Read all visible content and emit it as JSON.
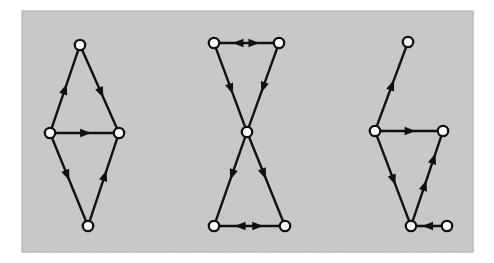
{
  "figure": {
    "width": 494,
    "height": 263,
    "background_color": "#ffffff",
    "panel": {
      "x": 22,
      "y": 11,
      "width": 451,
      "height": 241,
      "fill_color": "#c9c9c9",
      "border_color": "#9a9a9a"
    },
    "style": {
      "edge_color": "#101010",
      "edge_width": 2.4,
      "node_fill": "#ffffff",
      "node_stroke": "#101010",
      "node_stroke_width": 2.3,
      "node_radius": 5.2,
      "arrow_length": 11,
      "arrow_half_width": 4.2
    }
  },
  "chart_data": {
    "type": "diagram",
    "subtype": "directed-graph",
    "graphs": [
      {
        "id": "graph-left",
        "name": "diamond-graph",
        "nodes": [
          {
            "id": "T",
            "label": "top",
            "x": 80,
            "y": 45
          },
          {
            "id": "L",
            "label": "left",
            "x": 50,
            "y": 133
          },
          {
            "id": "R",
            "label": "right",
            "x": 119,
            "y": 133
          },
          {
            "id": "B",
            "label": "bottom",
            "x": 88,
            "y": 226
          }
        ],
        "edges": [
          {
            "from": "L",
            "to": "T",
            "arrows": [
              {
                "t": 0.5,
                "dir": "forward"
              }
            ]
          },
          {
            "from": "T",
            "to": "R",
            "arrows": [
              {
                "t": 0.55,
                "dir": "forward"
              }
            ]
          },
          {
            "from": "L",
            "to": "R",
            "arrows": [
              {
                "t": 0.52,
                "dir": "forward"
              }
            ]
          },
          {
            "from": "L",
            "to": "B",
            "arrows": [
              {
                "t": 0.45,
                "dir": "forward"
              }
            ]
          },
          {
            "from": "B",
            "to": "R",
            "arrows": [
              {
                "t": 0.55,
                "dir": "forward"
              }
            ]
          }
        ]
      },
      {
        "id": "graph-middle",
        "name": "bowtie-graph",
        "nodes": [
          {
            "id": "TL",
            "label": "top-left",
            "x": 214,
            "y": 43
          },
          {
            "id": "TR",
            "label": "top-right",
            "x": 279,
            "y": 43
          },
          {
            "id": "C",
            "label": "center",
            "x": 247,
            "y": 132
          },
          {
            "id": "BL",
            "label": "bottom-left",
            "x": 214,
            "y": 226
          },
          {
            "id": "BR",
            "label": "bottom-right",
            "x": 285,
            "y": 226
          }
        ],
        "edges": [
          {
            "from": "TL",
            "to": "TR",
            "arrows": [
              {
                "t": 0.34,
                "dir": "backward"
              },
              {
                "t": 0.64,
                "dir": "forward"
              }
            ]
          },
          {
            "from": "TL",
            "to": "C",
            "arrows": [
              {
                "t": 0.52,
                "dir": "forward"
              }
            ]
          },
          {
            "from": "TR",
            "to": "C",
            "arrows": [
              {
                "t": 0.5,
                "dir": "forward"
              }
            ]
          },
          {
            "from": "C",
            "to": "BL",
            "arrows": [
              {
                "t": 0.45,
                "dir": "forward"
              }
            ]
          },
          {
            "from": "C",
            "to": "BR",
            "arrows": [
              {
                "t": 0.44,
                "dir": "forward"
              }
            ]
          },
          {
            "from": "BL",
            "to": "BR",
            "arrows": [
              {
                "t": 0.34,
                "dir": "backward"
              },
              {
                "t": 0.64,
                "dir": "forward"
              }
            ]
          }
        ]
      },
      {
        "id": "graph-right",
        "name": "triangle-with-pendants-graph",
        "nodes": [
          {
            "id": "P1",
            "label": "top-pendant",
            "x": 408,
            "y": 42
          },
          {
            "id": "A",
            "label": "upper-left",
            "x": 375,
            "y": 131
          },
          {
            "id": "B",
            "label": "upper-right",
            "x": 443,
            "y": 131
          },
          {
            "id": "C",
            "label": "bottom",
            "x": 411,
            "y": 226
          },
          {
            "id": "P2",
            "label": "right-pendant",
            "x": 447,
            "y": 226
          }
        ],
        "edges": [
          {
            "from": "A",
            "to": "P1",
            "arrows": [
              {
                "t": 0.52,
                "dir": "forward"
              }
            ]
          },
          {
            "from": "A",
            "to": "B",
            "arrows": [
              {
                "t": 0.52,
                "dir": "forward"
              }
            ]
          },
          {
            "from": "A",
            "to": "C",
            "arrows": [
              {
                "t": 0.52,
                "dir": "forward"
              }
            ]
          },
          {
            "from": "C",
            "to": "B",
            "arrows": [
              {
                "t": 0.42,
                "dir": "forward"
              },
              {
                "t": 0.74,
                "dir": "forward"
              }
            ]
          },
          {
            "from": "P2",
            "to": "C",
            "arrows": [
              {
                "t": 0.56,
                "dir": "forward"
              }
            ]
          }
        ]
      }
    ]
  }
}
